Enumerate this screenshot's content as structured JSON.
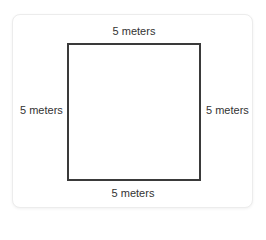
{
  "diagram": {
    "shape": "square",
    "sides": {
      "top": "5 meters",
      "bottom": "5 meters",
      "left": "5 meters",
      "right": "5 meters"
    },
    "colors": {
      "outline": "#3a3a3a",
      "text": "#333333",
      "card_border": "#ececec",
      "background": "#ffffff"
    }
  }
}
